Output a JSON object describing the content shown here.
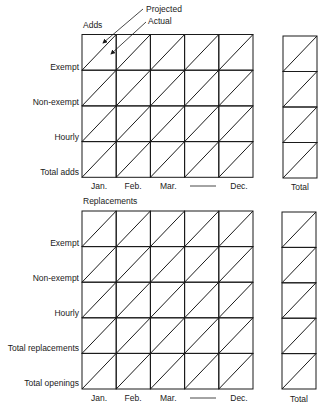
{
  "annotations": {
    "projected": "Projected",
    "actual": "Actual"
  },
  "adds": {
    "title": "Adds",
    "rows": [
      "Exempt",
      "Non-exempt",
      "Hourly",
      "Total adds"
    ],
    "months": [
      "Jan.",
      "Feb.",
      "Mar.",
      "Dec."
    ],
    "total_label": "Total"
  },
  "replacements": {
    "title": "Replacements",
    "rows": [
      "Exempt",
      "Non-exempt",
      "Hourly",
      "Total replacements",
      "Total openings"
    ],
    "months": [
      "Jan.",
      "Feb.",
      "Mar.",
      "Dec."
    ],
    "total_label": "Total"
  },
  "colors": {
    "line": "#1a1a1a",
    "background": "#ffffff"
  }
}
